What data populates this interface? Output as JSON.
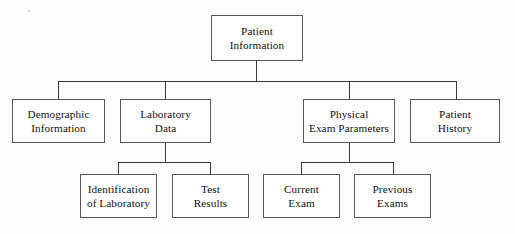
{
  "diagram": {
    "type": "tree",
    "background_color": "#fdfdfd",
    "box_border_color": "#575757",
    "line_color": "#3a3a3a",
    "text_color": "#111111",
    "nodes": {
      "root": {
        "id": "patient-information",
        "label": "Patient\nInformation",
        "level": 1
      },
      "level2": [
        {
          "id": "demographic-information",
          "label": "Demographic\nInformation",
          "level": 2
        },
        {
          "id": "laboratory-data",
          "label": "Laboratory\nData",
          "level": 2
        },
        {
          "id": "physical-exam-parameters",
          "label": "Physical\nExam Parameters",
          "level": 2
        },
        {
          "id": "patient-history",
          "label": "Patient\nHistory",
          "level": 2
        }
      ],
      "level3": [
        {
          "id": "identification-of-laboratory",
          "label": "Identification\nof Laboratory",
          "level": 3,
          "parent": "laboratory-data"
        },
        {
          "id": "test-results",
          "label": "Test\nResults",
          "level": 3,
          "parent": "laboratory-data"
        },
        {
          "id": "current-exam",
          "label": "Current\nExam",
          "level": 3,
          "parent": "physical-exam-parameters"
        },
        {
          "id": "previous-exams",
          "label": "Previous\nExams",
          "level": 3,
          "parent": "physical-exam-parameters"
        }
      ]
    }
  }
}
